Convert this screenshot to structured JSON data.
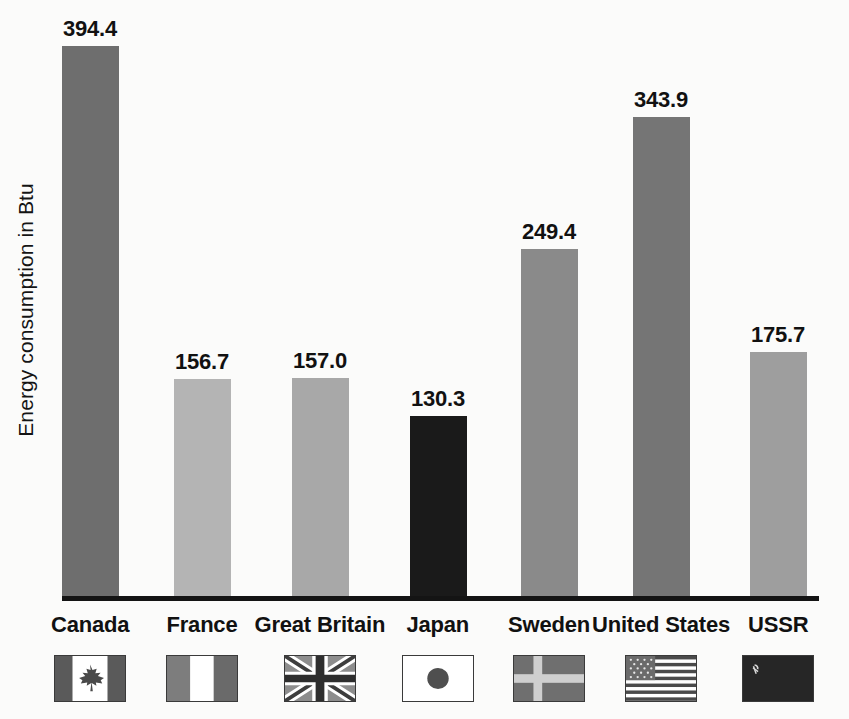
{
  "chart_data": {
    "type": "bar",
    "title": "",
    "subtitle": "",
    "xlabel": "",
    "ylabel": "Energy consumption in Btu",
    "categories": [
      "Canada",
      "France",
      "Great Britain",
      "Japan",
      "Sweden",
      "United States",
      "USSR"
    ],
    "values": [
      394.4,
      156.7,
      157.0,
      130.3,
      249.4,
      343.9,
      175.7
    ],
    "value_labels": [
      "394.4",
      "156.7",
      "157.0",
      "130.3",
      "249.4",
      "343.9",
      "175.7"
    ],
    "ylim": [
      0,
      420
    ],
    "grid": false,
    "legend": "none",
    "bar_colors": [
      "#6e6e6e",
      "#b4b4b4",
      "#a8a8a8",
      "#1a1a1a",
      "#8a8a8a",
      "#757575",
      "#9e9e9e"
    ],
    "axis_color": "#141414",
    "background": "#fbfbfa",
    "series": [
      {
        "name": "Energy consumption in Btu",
        "values": [
          394.4,
          156.7,
          157.0,
          130.3,
          249.4,
          343.9,
          175.7
        ]
      }
    ]
  },
  "axis": {
    "y_title": "Energy consumption in Btu"
  },
  "bars": [
    {
      "category": "Canada",
      "value": 394.4,
      "label": "394.4",
      "color": "#6e6e6e",
      "flag": "canada-flag"
    },
    {
      "category": "France",
      "value": 156.7,
      "label": "156.7",
      "color": "#b4b4b4",
      "flag": "france-flag"
    },
    {
      "category": "Great Britain",
      "value": 157.0,
      "label": "157.0",
      "color": "#a8a8a8",
      "flag": "great-britain-flag"
    },
    {
      "category": "Japan",
      "value": 130.3,
      "label": "130.3",
      "color": "#1a1a1a",
      "flag": "japan-flag"
    },
    {
      "category": "Sweden",
      "value": 249.4,
      "label": "249.4",
      "color": "#8a8a8a",
      "flag": "sweden-flag"
    },
    {
      "category": "United States",
      "value": 343.9,
      "label": "343.9",
      "color": "#757575",
      "flag": "united-states-flag"
    },
    {
      "category": "USSR",
      "value": 175.7,
      "label": "175.7",
      "color": "#9e9e9e",
      "flag": "ussr-flag"
    }
  ],
  "layout": {
    "plot_left": 62,
    "plot_width": 757,
    "baseline_y": 596,
    "px_per_unit": 1.4,
    "bar_width": 57,
    "slot_centers": [
      90,
      202,
      320,
      438,
      549,
      661,
      778
    ]
  }
}
